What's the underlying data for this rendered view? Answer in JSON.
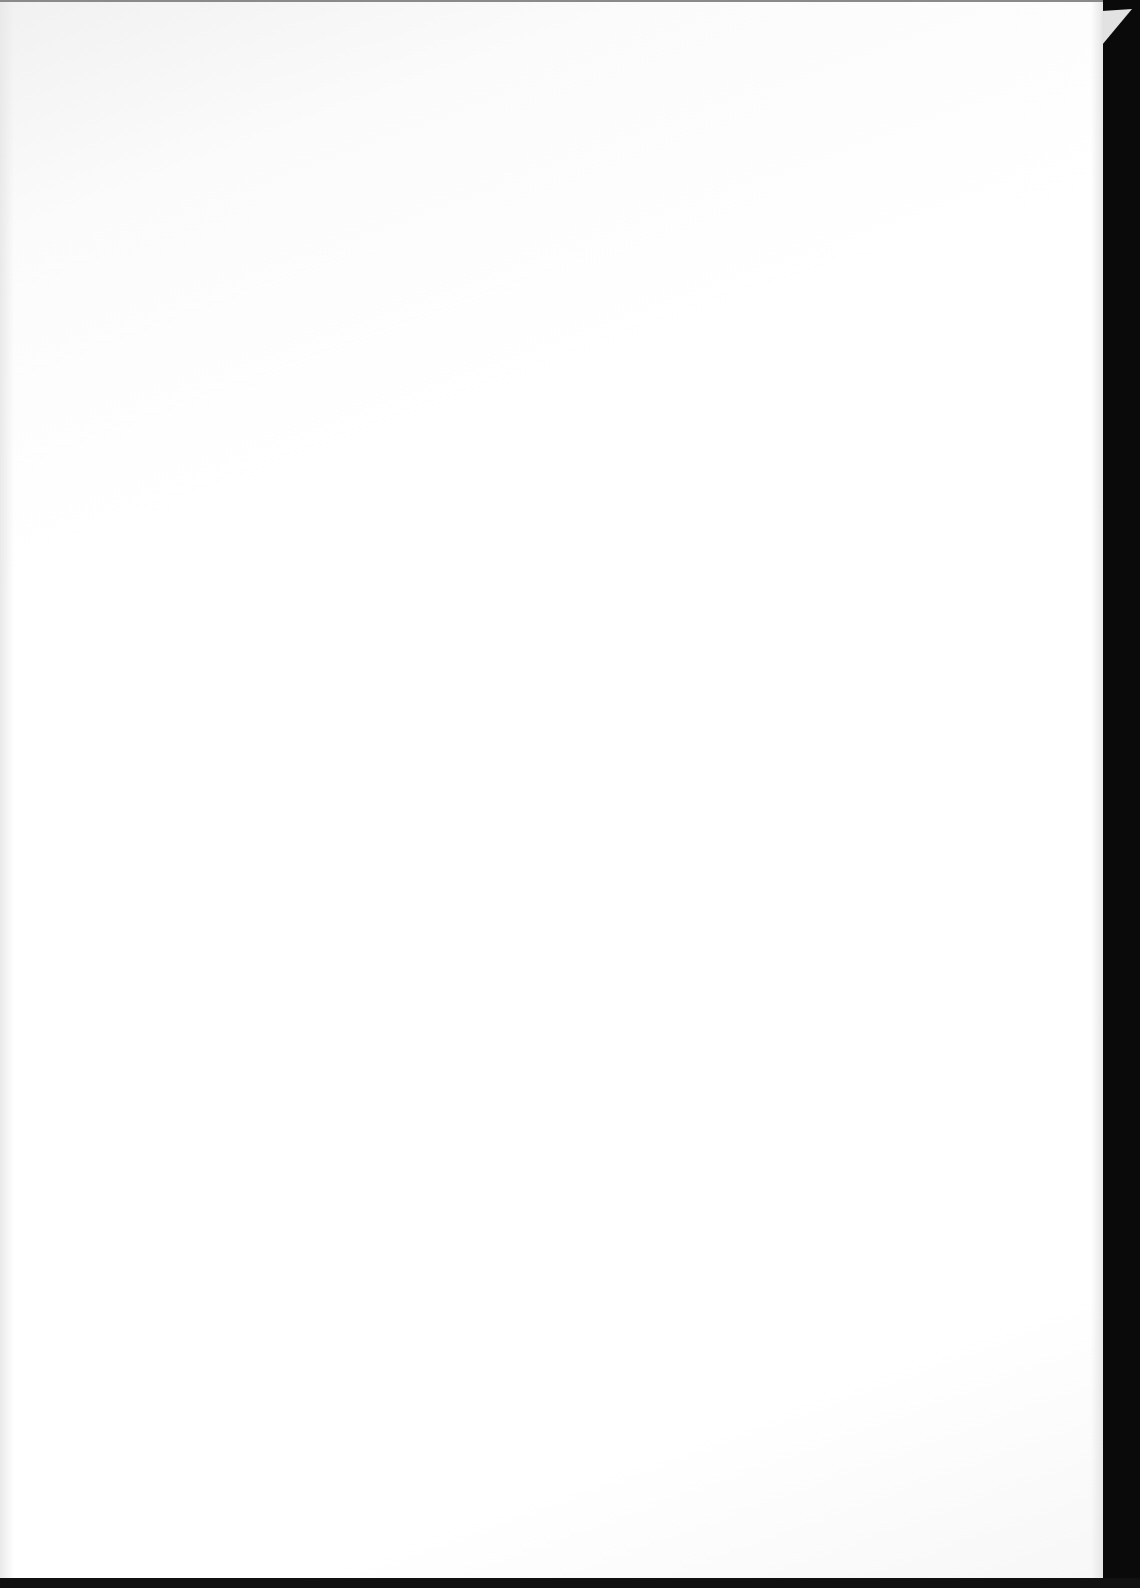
{
  "document": {
    "type": "scanned-page",
    "content": "",
    "colors": {
      "paper": "#ffffff",
      "background": "#0a0a0a"
    }
  }
}
